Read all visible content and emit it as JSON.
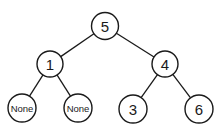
{
  "diagram": {
    "type": "binary-tree",
    "stroke_color": "#1a1a1a",
    "background": "#ffffff",
    "nodes": [
      {
        "id": "n5",
        "label": "5",
        "cx": 105,
        "cy": 26,
        "r": 13.5,
        "size": "big"
      },
      {
        "id": "n1",
        "label": "1",
        "cx": 50,
        "cy": 64,
        "r": 13,
        "size": "big"
      },
      {
        "id": "n4",
        "label": "4",
        "cx": 165,
        "cy": 64,
        "r": 13,
        "size": "big"
      },
      {
        "id": "nNone1",
        "label": "None",
        "cx": 22,
        "cy": 108,
        "r": 14,
        "size": "small"
      },
      {
        "id": "nNone2",
        "label": "None",
        "cx": 78,
        "cy": 108,
        "r": 14,
        "size": "small"
      },
      {
        "id": "n3",
        "label": "3",
        "cx": 133,
        "cy": 109,
        "r": 14,
        "size": "big"
      },
      {
        "id": "n6",
        "label": "6",
        "cx": 199,
        "cy": 109,
        "r": 14,
        "size": "big"
      }
    ],
    "edges": [
      {
        "from": "n5",
        "to": "n1"
      },
      {
        "from": "n5",
        "to": "n4"
      },
      {
        "from": "n1",
        "to": "nNone1"
      },
      {
        "from": "n1",
        "to": "nNone2"
      },
      {
        "from": "n4",
        "to": "n3"
      },
      {
        "from": "n4",
        "to": "n6"
      }
    ]
  }
}
